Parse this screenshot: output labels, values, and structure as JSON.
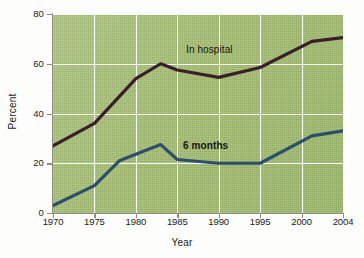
{
  "chart_data": {
    "type": "line",
    "title": "",
    "xlabel": "Year",
    "ylabel": "Percent",
    "grid": true,
    "legend_position": "inline-labels",
    "xlim": [
      1970,
      2004
    ],
    "ylim": [
      0,
      80
    ],
    "x_tick_labels": [
      "1970",
      "1975",
      "1980",
      "1985",
      "1990",
      "1995",
      "2000",
      "2004"
    ],
    "y_tick_labels": [
      "0",
      "20",
      "40",
      "60",
      "80"
    ],
    "y_ticks": [
      0,
      20,
      40,
      60,
      80
    ],
    "plot_background_color": "#a9c37a",
    "gridline_color": "#ffffff",
    "series": [
      {
        "name": "In hospital",
        "color": "#3a1f2b",
        "x": [
          1970,
          1975,
          1980,
          1983,
          1985,
          1990,
          1995,
          2001,
          2004
        ],
        "values": [
          27,
          36,
          54,
          60,
          57.5,
          54.5,
          58.5,
          69,
          70.5
        ]
      },
      {
        "name": "6 months",
        "color": "#2d4f6b",
        "x": [
          1970,
          1975,
          1978,
          1983,
          1985,
          1990,
          1995,
          2001,
          2004
        ],
        "values": [
          3,
          11,
          21,
          27.5,
          21.5,
          20,
          20,
          31,
          33
        ]
      }
    ]
  },
  "axes": {
    "y_title": "Percent",
    "x_title": "Year"
  },
  "labels": {
    "in_hospital": "In hospital",
    "six_months": "6 months"
  }
}
